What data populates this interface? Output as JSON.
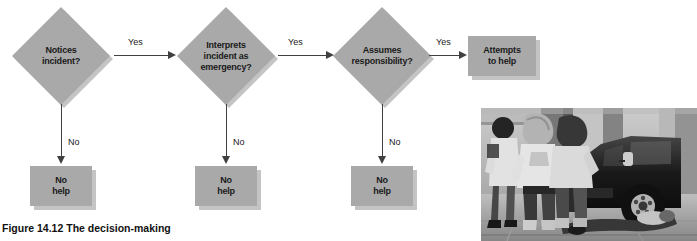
{
  "figure": {
    "caption_number": "Figure 14.12",
    "caption_title": "The decision-making"
  },
  "flowchart": {
    "nodes": [
      {
        "id": "notices",
        "type": "decision",
        "label_lines": [
          "Notices",
          "incident?"
        ]
      },
      {
        "id": "interprets",
        "type": "decision",
        "label_lines": [
          "Interprets",
          "incident as",
          "emergency?"
        ]
      },
      {
        "id": "assumes",
        "type": "decision",
        "label_lines": [
          "Assumes",
          "responsibility?"
        ]
      },
      {
        "id": "attempts",
        "type": "box",
        "label_lines": [
          "Attempts",
          "to help"
        ]
      },
      {
        "id": "nohelp1",
        "type": "box",
        "label_lines": [
          "No",
          "help"
        ]
      },
      {
        "id": "nohelp2",
        "type": "box",
        "label_lines": [
          "No",
          "help"
        ]
      },
      {
        "id": "nohelp3",
        "type": "box",
        "label_lines": [
          "No",
          "help"
        ]
      }
    ],
    "edges": [
      {
        "from": "notices",
        "to": "interprets",
        "label": "Yes",
        "direction": "right"
      },
      {
        "from": "interprets",
        "to": "assumes",
        "label": "Yes",
        "direction": "right"
      },
      {
        "from": "assumes",
        "to": "attempts",
        "label": "Yes",
        "direction": "right"
      },
      {
        "from": "notices",
        "to": "nohelp1",
        "label": "No",
        "direction": "down"
      },
      {
        "from": "interprets",
        "to": "nohelp2",
        "label": "No",
        "direction": "down"
      },
      {
        "from": "assumes",
        "to": "nohelp3",
        "label": "No",
        "direction": "down"
      }
    ]
  },
  "node_text": {
    "notices_l1": "Notices",
    "notices_l2": "incident?",
    "interprets_l1": "Interprets",
    "interprets_l2": "incident as",
    "interprets_l3": "emergency?",
    "assumes_l1": "Assumes",
    "assumes_l2": "responsibility?",
    "attempts_l1": "Attempts",
    "attempts_l2": "to help",
    "nohelp1_l1": "No",
    "nohelp1_l2": "help",
    "nohelp2_l1": "No",
    "nohelp2_l2": "help",
    "nohelp3_l1": "No",
    "nohelp3_l2": "help"
  },
  "edge_labels": {
    "yes1": "Yes",
    "yes2": "Yes",
    "yes3": "Yes",
    "no1": "No",
    "no2": "No",
    "no3": "No"
  },
  "photo": {
    "alt": "Black and white photograph of pedestrians walking past a person lying on the sidewalk beside a parked van"
  },
  "colors": {
    "node_fill": "#a9a9a9",
    "node_shadow": "#c4c4c4",
    "arrow": "#404040",
    "text": "#1a1a1a",
    "background": "#ffffff"
  }
}
